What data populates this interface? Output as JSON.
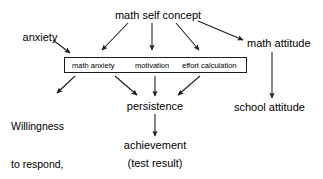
{
  "diagram": {
    "title_text": "math self concept",
    "type": "path-diagram",
    "background_color": "#ffffff",
    "line_color": "#1a1a1a",
    "nodes": {
      "math_self_concept": "math self concept",
      "anxiety": "anxiety",
      "math_attitude": "math attitude",
      "school_attitude": "school attitude",
      "persistence": "persistence",
      "achievement": "achievement",
      "achievement_note": "(test result)",
      "willingness_line1": "Willingness",
      "willingness_line2": "to respond,",
      "willingness_line3": "interact"
    },
    "construct_box": {
      "items": [
        {
          "label": "math anxiety"
        },
        {
          "label": "motivation"
        },
        {
          "label": "effort calculation"
        }
      ]
    },
    "edges": [
      {
        "from": "math self concept",
        "to": "math anxiety"
      },
      {
        "from": "math self concept",
        "to": "motivation"
      },
      {
        "from": "math self concept",
        "to": "effort calculation"
      },
      {
        "from": "math self concept",
        "to": "math attitude"
      },
      {
        "from": "anxiety",
        "to": "math anxiety"
      },
      {
        "from": "construct box",
        "to": "Willingness to respond, interact"
      },
      {
        "from": "math anxiety",
        "to": "persistence"
      },
      {
        "from": "motivation",
        "to": "persistence"
      },
      {
        "from": "effort calculation",
        "to": "persistence"
      },
      {
        "from": "persistence",
        "to": "achievement"
      },
      {
        "from": "math attitude",
        "to": "school attitude"
      }
    ]
  }
}
